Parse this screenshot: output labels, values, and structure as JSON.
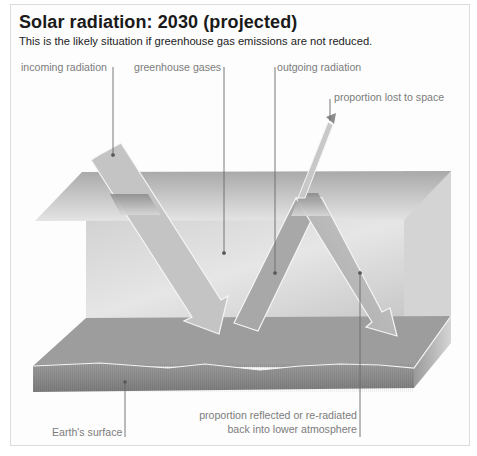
{
  "header": {
    "title": "Solar radiation: 2030 (projected)",
    "subtitle": "This is the likely situation if greenhouse gas emissions are not reduced."
  },
  "labels": {
    "incoming_radiation": "incoming radiation",
    "greenhouse_gases": "greenhouse gases",
    "outgoing_radiation": "outgoing radiation",
    "proportion_lost": "proportion lost to space",
    "earths_surface": "Earth's surface",
    "reflected_line1": "proportion reflected or re-radiated",
    "reflected_line2": "back into lower atmosphere"
  },
  "colors": {
    "background": "#ffffff",
    "frame_border": "#dcdcdc",
    "ground_top": "#9a9a9a",
    "ground_side": "#8a8a8a",
    "atmosphere_layer": "#b8b8b8",
    "back_wall": "#cfcfcf",
    "arrow_fill": "#c4c4c4",
    "arrow_outline": "#ffffff",
    "leader_line": "#666666",
    "label_text": "#7c7c7c"
  }
}
